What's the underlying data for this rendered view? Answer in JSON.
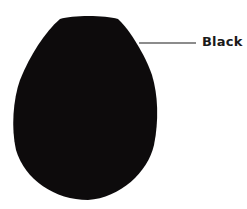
{
  "diagram": {
    "shape": "egg",
    "fill_color": "#0d0b0c",
    "leader_line_color": "#1a1a1a",
    "label": "Black"
  }
}
